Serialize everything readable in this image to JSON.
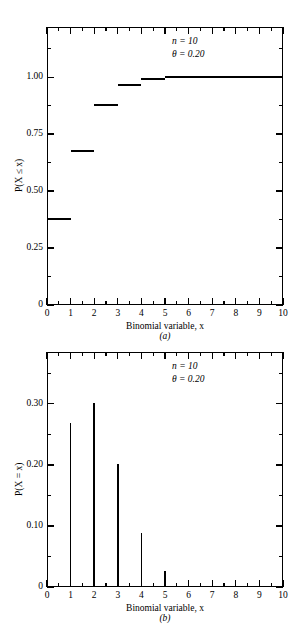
{
  "figure": {
    "panels": [
      {
        "tag": "(a)",
        "xlabel": "Binomial variable, x",
        "ylabel": "P(X ≤ x)",
        "annotation": {
          "n": "n = 10",
          "theta": "θ = 0.20"
        },
        "x_ticklabels": [
          "0",
          "1",
          "2",
          "3",
          "4",
          "5",
          "6",
          "7",
          "8",
          "9",
          "10"
        ],
        "y_ticklabels": [
          "0",
          "0.25",
          "0.50",
          "0.75",
          "1.00"
        ]
      },
      {
        "tag": "(b)",
        "xlabel": "Binomial variable, x",
        "ylabel": "P(X = x)",
        "annotation": {
          "n": "n = 10",
          "theta": "θ = 0.20"
        },
        "x_ticklabels": [
          "0",
          "1",
          "2",
          "3",
          "4",
          "5",
          "6",
          "7",
          "8",
          "9",
          "10"
        ],
        "y_ticklabels": [
          "0",
          "0.10",
          "0.20",
          "0.30"
        ]
      }
    ]
  },
  "chart_data": [
    {
      "type": "line",
      "subtype": "step",
      "title": "",
      "panel": "(a)",
      "xlabel": "Binomial variable, x",
      "ylabel": "P(X ≤ x)",
      "annotations": [
        "n = 10",
        "θ = 0.20"
      ],
      "xlim": [
        0,
        10
      ],
      "ylim": [
        0,
        1.22
      ],
      "xticks": [
        0,
        1,
        2,
        3,
        4,
        5,
        6,
        7,
        8,
        9,
        10
      ],
      "yticks": [
        0,
        0.25,
        0.5,
        0.75,
        1.0
      ],
      "minor_ticks": true,
      "grid": false,
      "legend": null,
      "x": [
        0,
        1,
        2,
        3,
        4,
        5,
        6,
        7,
        8,
        9,
        10
      ],
      "values": [
        0.3758,
        0.6778,
        0.8791,
        0.9672,
        0.9936,
        0.9999,
        1.0,
        1.0,
        1.0,
        1.0,
        1.0
      ],
      "steps": [
        {
          "x_start": 0,
          "x_end": 1,
          "y": 0.3758
        },
        {
          "x_start": 1,
          "x_end": 2,
          "y": 0.6778
        },
        {
          "x_start": 2,
          "x_end": 3,
          "y": 0.8791
        },
        {
          "x_start": 3,
          "x_end": 4,
          "y": 0.9672
        },
        {
          "x_start": 4,
          "x_end": 5,
          "y": 0.9936
        },
        {
          "x_start": 5,
          "x_end": 10,
          "y": 1.0
        }
      ]
    },
    {
      "type": "bar",
      "subtype": "spike",
      "title": "",
      "panel": "(b)",
      "xlabel": "Binomial variable, x",
      "ylabel": "P(X = x)",
      "annotations": [
        "n = 10",
        "θ = 0.20"
      ],
      "xlim": [
        0,
        10
      ],
      "ylim": [
        0,
        0.385
      ],
      "xticks": [
        0,
        1,
        2,
        3,
        4,
        5,
        6,
        7,
        8,
        9,
        10
      ],
      "yticks": [
        0,
        0.1,
        0.2,
        0.3
      ],
      "minor_ticks": true,
      "grid": false,
      "legend": null,
      "categories": [
        0,
        1,
        2,
        3,
        4,
        5,
        6,
        7,
        8,
        9,
        10
      ],
      "values": [
        0.0,
        0.2684,
        0.302,
        0.2013,
        0.0881,
        0.0264,
        0.0,
        0.0,
        0.0,
        0.0,
        0.0
      ]
    }
  ]
}
